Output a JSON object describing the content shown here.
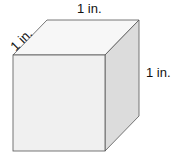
{
  "diagram": {
    "shape": "cube",
    "labels": {
      "top_edge": "1 in.",
      "depth_edge": "1 in.",
      "right_edge": "1 in."
    },
    "colors": {
      "front_face": "#f0f0f0",
      "top_face": "#f7f7f7",
      "side_face": "#dcdcdc",
      "edge": "#555555"
    }
  }
}
